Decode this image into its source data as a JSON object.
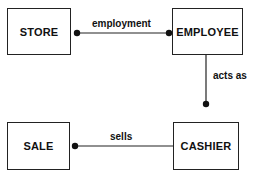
{
  "diagram": {
    "type": "entity-relationship",
    "entities": [
      {
        "id": "store",
        "label": "STORE"
      },
      {
        "id": "employee",
        "label": "EMPLOYEE"
      },
      {
        "id": "sale",
        "label": "SALE"
      },
      {
        "id": "cashier",
        "label": "CASHIER"
      }
    ],
    "relationships": [
      {
        "label": "employment",
        "from": "store",
        "to": "employee",
        "dots": [
          "store-end",
          "employee-end"
        ]
      },
      {
        "label": "acts as",
        "from": "employee",
        "to": "cashier",
        "dots": [
          "cashier-end"
        ]
      },
      {
        "label": "sells",
        "from": "sale",
        "to": "cashier",
        "dots": [
          "sale-end"
        ]
      }
    ],
    "colors": {
      "line": "#222222",
      "background": "#ffffff"
    }
  }
}
